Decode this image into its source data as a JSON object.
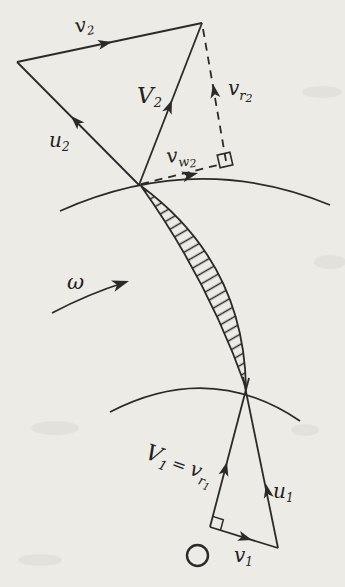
{
  "figure": {
    "kind": "velocity-triangle-diagram",
    "colors": {
      "paper": "#edebe6",
      "ink": "#2a2a28"
    }
  },
  "outlet_triangle": {
    "v2": {
      "base": "v",
      "sub": "2"
    },
    "u2": {
      "base": "u",
      "sub": "2"
    },
    "V2": {
      "base": "V",
      "sub": "2"
    },
    "vr2": {
      "base": "v",
      "sub": "r",
      "sub2": "2"
    },
    "vw2": {
      "base": "v",
      "sub": "w",
      "sub2": "2"
    }
  },
  "rotation": {
    "omega": "ω"
  },
  "inlet_triangle": {
    "V1_eq_vr1": {
      "base1": "V",
      "sub1": "1",
      "eq": "=",
      "base2": "v",
      "sub2": "r",
      "subsub": "1"
    },
    "u1": {
      "base": "u",
      "sub": "1"
    },
    "v1": {
      "base": "v",
      "sub": "1"
    }
  }
}
